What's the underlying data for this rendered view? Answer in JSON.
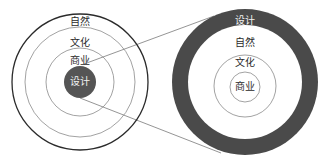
{
  "diagram": {
    "type": "concentric-circles-zoom",
    "colors": {
      "background": "#ffffff",
      "ring_stroke_outer": "#2b2b2b",
      "ring_stroke": "#8a8a8a",
      "design_fill": "#555555",
      "design_ring_fill": "#4a4a4a",
      "connector": "#7a7a7a"
    },
    "left": {
      "labels": {
        "nature": "自然",
        "culture": "文化",
        "business": "商业",
        "design": "设计"
      },
      "order_outer_to_inner": [
        "自然",
        "文化",
        "商业",
        "设计"
      ]
    },
    "right": {
      "labels": {
        "design": "设计",
        "nature": "自然",
        "culture": "文化",
        "business": "商业"
      },
      "order_outer_to_inner": [
        "设计",
        "自然",
        "文化",
        "商业"
      ]
    }
  }
}
